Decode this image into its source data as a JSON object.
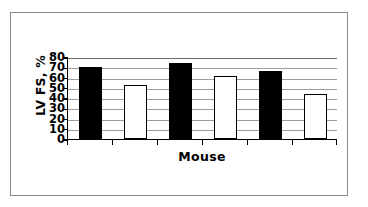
{
  "figure": {
    "frame_color": "#8a8a8a",
    "background": "#ffffff"
  },
  "chart_data": {
    "type": "bar",
    "title": "",
    "subtitle": "",
    "xlabel": "Mouse",
    "ylabel": "LV FS, %",
    "categories": [
      "1",
      "2",
      "3",
      "4",
      "5",
      "6"
    ],
    "values": [
      70,
      53,
      74,
      61,
      66,
      44
    ],
    "bar_styles": [
      "filled",
      "hollow",
      "filled",
      "hollow",
      "filled",
      "hollow"
    ],
    "bar_colors": [
      "#000000",
      "#ffffff",
      "#000000",
      "#ffffff",
      "#000000",
      "#ffffff"
    ],
    "bar_edge_color": "#000000",
    "ylim": [
      0,
      80
    ],
    "xlim": [
      0,
      6
    ],
    "ytick_labels": [
      "80",
      "70",
      "60",
      "50",
      "40",
      "30",
      "20",
      "10",
      "0"
    ],
    "ytick_values": [
      80,
      70,
      60,
      50,
      40,
      30,
      20,
      10,
      0
    ],
    "ytick_step": 10,
    "grid": true,
    "gridline_color": "#9c9c9c",
    "gridline_axis": "y",
    "legend": "none",
    "legend_position": "none",
    "annotations": [],
    "axis_color": "#000000"
  }
}
